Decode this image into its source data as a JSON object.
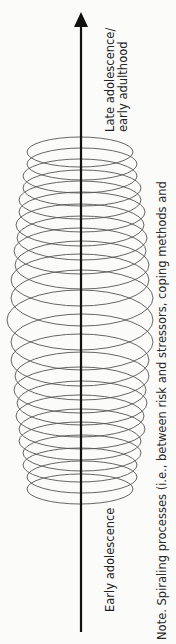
{
  "diagram": {
    "type": "spiral-timeline",
    "axis": {
      "direction": "up",
      "start_label": "Early adolescence",
      "end_label_line1": "Late adolescence/",
      "end_label_line2": "early adulthood"
    },
    "spiral": {
      "loops": 27,
      "description": "Stacked overlapping ellipses along a vertical arrow, widest in the middle"
    },
    "note": "Note. Spiraling processes (i.e., between risk and stressors, coping methods and"
  },
  "colors": {
    "background": "#fbfbfa",
    "arrow": "#111111",
    "ellipse_stroke": "#555555",
    "text": "#222222"
  }
}
